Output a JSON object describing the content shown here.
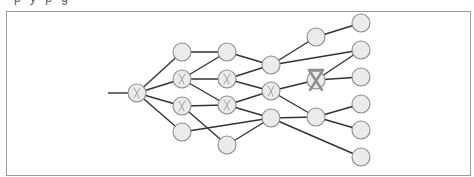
{
  "figure": {
    "caption_remnant": "p y p g",
    "frame": {
      "x": 6,
      "y": 11,
      "width": 464,
      "height": 164,
      "stroke": "#9a9a9a"
    },
    "style": {
      "edge_color": "#333333",
      "node_fill": "#ebebeb",
      "node_stroke": "#8c8c8c",
      "node_radius": 9,
      "mark_color": "#a3a3a3",
      "strong_mark_color": "#8f8f8f"
    },
    "input_line": {
      "x1": 108,
      "y1": 93,
      "x2": 128,
      "y2": 93
    },
    "nodes": [
      {
        "id": "A",
        "x": 137,
        "y": 93,
        "mark": "x"
      },
      {
        "id": "B1",
        "x": 182,
        "y": 52,
        "mark": "none"
      },
      {
        "id": "B2",
        "x": 182,
        "y": 79,
        "mark": "x"
      },
      {
        "id": "B3",
        "x": 182,
        "y": 106,
        "mark": "x"
      },
      {
        "id": "B4",
        "x": 182,
        "y": 132,
        "mark": "none"
      },
      {
        "id": "C1",
        "x": 227,
        "y": 52,
        "mark": "none"
      },
      {
        "id": "C2",
        "x": 227,
        "y": 79,
        "mark": "x"
      },
      {
        "id": "C3",
        "x": 227,
        "y": 105,
        "mark": "x"
      },
      {
        "id": "C4",
        "x": 227,
        "y": 145,
        "mark": "none"
      },
      {
        "id": "D1",
        "x": 271,
        "y": 65,
        "mark": "none"
      },
      {
        "id": "D2",
        "x": 271,
        "y": 91,
        "mark": "x"
      },
      {
        "id": "D3",
        "x": 271,
        "y": 118,
        "mark": "none"
      },
      {
        "id": "E1",
        "x": 316,
        "y": 37,
        "mark": "none"
      },
      {
        "id": "E2",
        "x": 316,
        "y": 80,
        "mark": "crossed-out"
      },
      {
        "id": "E3",
        "x": 316,
        "y": 117,
        "mark": "none"
      },
      {
        "id": "F1",
        "x": 361,
        "y": 23,
        "mark": "none"
      },
      {
        "id": "F2",
        "x": 361,
        "y": 50,
        "mark": "none"
      },
      {
        "id": "F3",
        "x": 361,
        "y": 77,
        "mark": "none"
      },
      {
        "id": "F4",
        "x": 361,
        "y": 104,
        "mark": "none"
      },
      {
        "id": "F5",
        "x": 361,
        "y": 130,
        "mark": "none"
      },
      {
        "id": "F6",
        "x": 361,
        "y": 157,
        "mark": "none"
      }
    ],
    "edges": [
      [
        "A",
        "B1"
      ],
      [
        "A",
        "B2"
      ],
      [
        "A",
        "B3"
      ],
      [
        "A",
        "B4"
      ],
      [
        "B1",
        "C1"
      ],
      [
        "B2",
        "C1"
      ],
      [
        "B2",
        "C2"
      ],
      [
        "B2",
        "C3"
      ],
      [
        "B3",
        "C3"
      ],
      [
        "B3",
        "C4"
      ],
      [
        "B4",
        "D3"
      ],
      [
        "C1",
        "D1"
      ],
      [
        "C2",
        "D1"
      ],
      [
        "C2",
        "D2"
      ],
      [
        "C3",
        "D2"
      ],
      [
        "C3",
        "D3"
      ],
      [
        "C4",
        "D3"
      ],
      [
        "D1",
        "E1"
      ],
      [
        "D1",
        "F2"
      ],
      [
        "D2",
        "E2"
      ],
      [
        "D2",
        "E3"
      ],
      [
        "D3",
        "E3"
      ],
      [
        "D3",
        "F6"
      ],
      [
        "E1",
        "F1"
      ],
      [
        "E2",
        "F2"
      ],
      [
        "E2",
        "F3"
      ],
      [
        "E3",
        "F4"
      ],
      [
        "E3",
        "F5"
      ]
    ]
  }
}
